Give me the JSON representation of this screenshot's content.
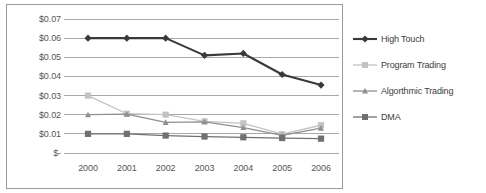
{
  "chart_data": {
    "type": "line",
    "title": "",
    "xlabel": "",
    "ylabel": "",
    "categories": [
      "2000",
      "2001",
      "2002",
      "2003",
      "2004",
      "2005",
      "2006"
    ],
    "x": [
      2000,
      2001,
      2002,
      2003,
      2004,
      2005,
      2006
    ],
    "ylim": [
      0,
      0.07
    ],
    "ytick_values": [
      0.07,
      0.06,
      0.05,
      0.04,
      0.03,
      0.02,
      0.01,
      0
    ],
    "ytick_labels": [
      "$0.07",
      "$0.06",
      "$0.05",
      "$0.04",
      "$0.03",
      "$0.02",
      "$0.01",
      "$-"
    ],
    "grid": true,
    "grid_axis": "y",
    "legend_position": "right",
    "series": [
      {
        "name": "High Touch",
        "marker": "diamond",
        "color": "#3a3a3a",
        "values": [
          0.06,
          0.06,
          0.06,
          0.051,
          0.052,
          0.041,
          0.0355
        ]
      },
      {
        "name": "Program Trading",
        "marker": "square",
        "color": "#c3c3c3",
        "values": [
          0.03,
          0.0205,
          0.02,
          0.0165,
          0.0155,
          0.0098,
          0.0145
        ]
      },
      {
        "name": "Algorthmic Trading",
        "marker": "triangle",
        "color": "#8f8f8f",
        "values": [
          0.02,
          0.0203,
          0.016,
          0.0163,
          0.0133,
          0.0092,
          0.013
        ]
      },
      {
        "name": "DMA",
        "marker": "square",
        "color": "#707070",
        "values": [
          0.01,
          0.01,
          0.0091,
          0.0086,
          0.0082,
          0.0078,
          0.0075
        ]
      }
    ]
  },
  "legend": {
    "items": [
      {
        "label": "High Touch"
      },
      {
        "label": "Program Trading"
      },
      {
        "label": "Algorthmic Trading"
      },
      {
        "label": "DMA"
      }
    ]
  },
  "colors": {
    "plot_border": "#9a9a9a",
    "gridline": "#a8a8a8",
    "axis_text": "#565656",
    "legend_text": "#3d3d3d",
    "background": "#ffffff"
  }
}
